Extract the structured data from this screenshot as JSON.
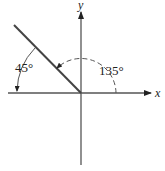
{
  "diagram": {
    "type": "angle-on-coordinate-axes",
    "axes": {
      "x_label": "x",
      "y_label": "y"
    },
    "ray": {
      "direction_degrees": 135,
      "quadrant": "II"
    },
    "angles": [
      {
        "label": "45°",
        "value_degrees": 45,
        "measured_from": "ray",
        "measured_to": "negative x-axis",
        "style": "solid",
        "arrow_at": "negative x-axis"
      },
      {
        "label": "135°",
        "value_degrees": 135,
        "measured_from": "positive x-axis",
        "measured_to": "ray",
        "style": "dashed",
        "arrow_at": "ray"
      }
    ],
    "colors": {
      "line": "#555555",
      "text": "#222222",
      "background": "#ffffff"
    }
  }
}
